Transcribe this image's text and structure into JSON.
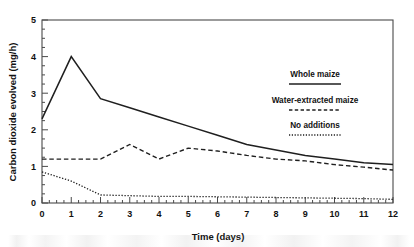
{
  "chart_data": {
    "type": "line",
    "title": "",
    "xlabel": "Time (days)",
    "ylabel": "Carbon dioxide evolved (mg/h)",
    "xlim": [
      0,
      12
    ],
    "ylim": [
      0,
      5
    ],
    "xticks": [
      "0",
      "1",
      "2",
      "3",
      "4",
      "5",
      "6",
      "7",
      "8",
      "9",
      "10",
      "11",
      "12"
    ],
    "yticks": [
      "0",
      "1",
      "2",
      "3",
      "4",
      "5"
    ],
    "x_minor_tick_step": 0.25,
    "y_minor_tick_step": 0.25,
    "grid": false,
    "legend_position": "upper-right-inside",
    "x": [
      0,
      1,
      2,
      3,
      4,
      5,
      6,
      7,
      8,
      9,
      10,
      11,
      12
    ],
    "series": [
      {
        "name": "Whole maize",
        "style": "solid",
        "color": "#1f1f1f",
        "values": [
          2.3,
          4.0,
          2.85,
          2.6,
          2.35,
          2.1,
          1.85,
          1.6,
          1.45,
          1.3,
          1.2,
          1.1,
          1.05
        ]
      },
      {
        "name": "Water-extracted maize",
        "style": "dashed",
        "color": "#1f1f1f",
        "values": [
          1.2,
          1.2,
          1.2,
          1.6,
          1.2,
          1.5,
          1.42,
          1.3,
          1.2,
          1.15,
          1.05,
          0.98,
          0.9
        ]
      },
      {
        "name": "No additions",
        "style": "dotted",
        "color": "#1f1f1f",
        "values": [
          0.85,
          0.6,
          0.22,
          0.2,
          0.18,
          0.18,
          0.17,
          0.16,
          0.15,
          0.14,
          0.13,
          0.12,
          0.1
        ]
      }
    ]
  },
  "legend": {
    "items": [
      {
        "label": "Whole maize",
        "style": "solid"
      },
      {
        "label": "Water-extracted maize",
        "style": "dashed"
      },
      {
        "label": "No additions",
        "style": "dotted"
      }
    ]
  }
}
